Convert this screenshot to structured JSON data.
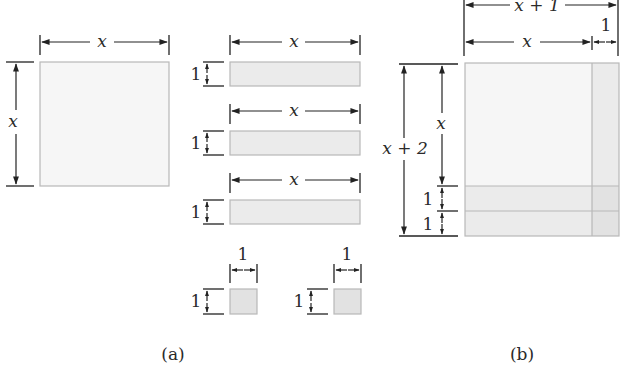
{
  "figure": {
    "panel_a": {
      "caption": "(a)",
      "square": {
        "width_label": "x",
        "height_label": "x"
      },
      "strips": [
        {
          "width_label": "x",
          "height_label": "1"
        },
        {
          "width_label": "x",
          "height_label": "1"
        },
        {
          "width_label": "x",
          "height_label": "1"
        }
      ],
      "unit_squares": [
        {
          "width_label": "1",
          "height_label": "1"
        },
        {
          "width_label": "1",
          "height_label": "1"
        }
      ]
    },
    "panel_b": {
      "caption": "(b)",
      "top_outer_label": "x + 1",
      "top_inner_label": "x",
      "top_small_label": "1",
      "left_outer_label": "x + 2",
      "left_inner_label": "x",
      "left_unit_labels": [
        "1",
        "1"
      ]
    },
    "colors": {
      "square_fill": "#f6f6f6",
      "strip_fill": "#ebebeb",
      "unit_fill": "#e2e2e2",
      "border": "#b8b8b8",
      "ink": "#222222"
    }
  }
}
